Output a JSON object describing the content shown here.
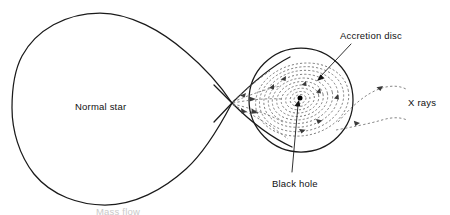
{
  "figure": {
    "background_color": "#ffffff",
    "width": 450,
    "height": 215
  },
  "labels": {
    "normal_star": "Normal star",
    "accretion_disc": "Accretion disc",
    "black_hole": "Black hole",
    "x_rays": "X rays",
    "cropped_caption": "Mass flow"
  },
  "colors": {
    "outline": "#1a1a1a",
    "dashed_flow": "#6f6f6f",
    "text": "#111111",
    "faint_text": "#c9c9c9",
    "black_hole_dot": "#000000"
  },
  "geometry": {
    "lagrange_point": {
      "x": 232,
      "y": 103
    },
    "star_lobe": {
      "left_x": 12,
      "top_y": 13,
      "bottom_y": 205,
      "tip_x": 232,
      "tip_y": 103
    },
    "disc_circle": {
      "cx": 301,
      "cy": 100,
      "r": 52
    },
    "black_hole_dot": {
      "cx": 300,
      "cy": 98,
      "r": 2.4
    },
    "spiral_turns": 9,
    "xray_streams": 2
  },
  "label_positions": {
    "normal_star": {
      "x": 75,
      "y": 110
    },
    "accretion_disc": {
      "x": 340,
      "y": 39
    },
    "black_hole": {
      "x": 272,
      "y": 187
    },
    "x_rays": {
      "x": 408,
      "y": 106
    },
    "cropped_caption": {
      "x": 96,
      "y": 214
    }
  },
  "icons": {
    "flow_arrow": "arrowhead-icon",
    "leader_arrow": "leader-arrowhead-icon",
    "singularity": "black-hole-dot-icon"
  }
}
